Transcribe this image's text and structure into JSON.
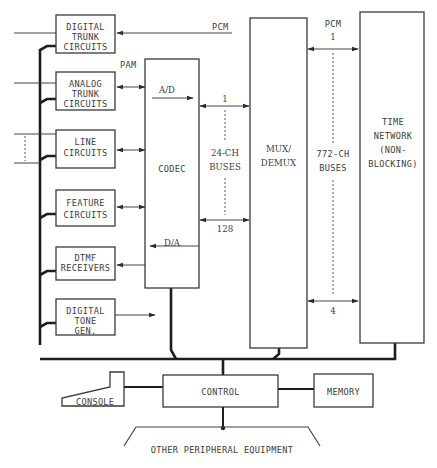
{
  "diagram": {
    "left_blocks": [
      {
        "id": "digital-trunk",
        "lines": [
          "DIGITAL",
          "TRUNK",
          "CIRCUITS"
        ]
      },
      {
        "id": "analog-trunk",
        "lines": [
          "ANALOG",
          "TRUNK",
          "CIRCUITS"
        ]
      },
      {
        "id": "line-circuits",
        "lines": [
          "LINE",
          "CIRCUITS"
        ]
      },
      {
        "id": "feature-circuits",
        "lines": [
          "FEATURE",
          "CIRCUITS"
        ]
      },
      {
        "id": "dtmf-receivers",
        "lines": [
          "DTMF",
          "RECEIVERS"
        ]
      },
      {
        "id": "digital-tone-gen",
        "lines": [
          "DIGITAL",
          "TONE",
          "GEN."
        ]
      }
    ],
    "codec": {
      "label": "CODEC",
      "ad": "A/D",
      "da": "D/A"
    },
    "pam_label": "PAM",
    "pcm_top_label": "PCM",
    "bus24": {
      "top": "1",
      "line1": "24-CH",
      "line2": "BUSES",
      "bottom": "128"
    },
    "mux": {
      "line1": "MUX/",
      "line2": "DEMUX"
    },
    "bus772": {
      "pcm": "PCM",
      "top": "1",
      "line1": "772-CH",
      "line2": "BUSES",
      "bottom": "4"
    },
    "time_network": {
      "lines": [
        "TIME",
        "NETWORK",
        "(NON-",
        "BLOCKING)"
      ]
    },
    "console": "CONSOLE",
    "control": "CONTROL",
    "memory": "MEMORY",
    "peripheral": "OTHER PERIPHERAL EQUIPMENT"
  }
}
